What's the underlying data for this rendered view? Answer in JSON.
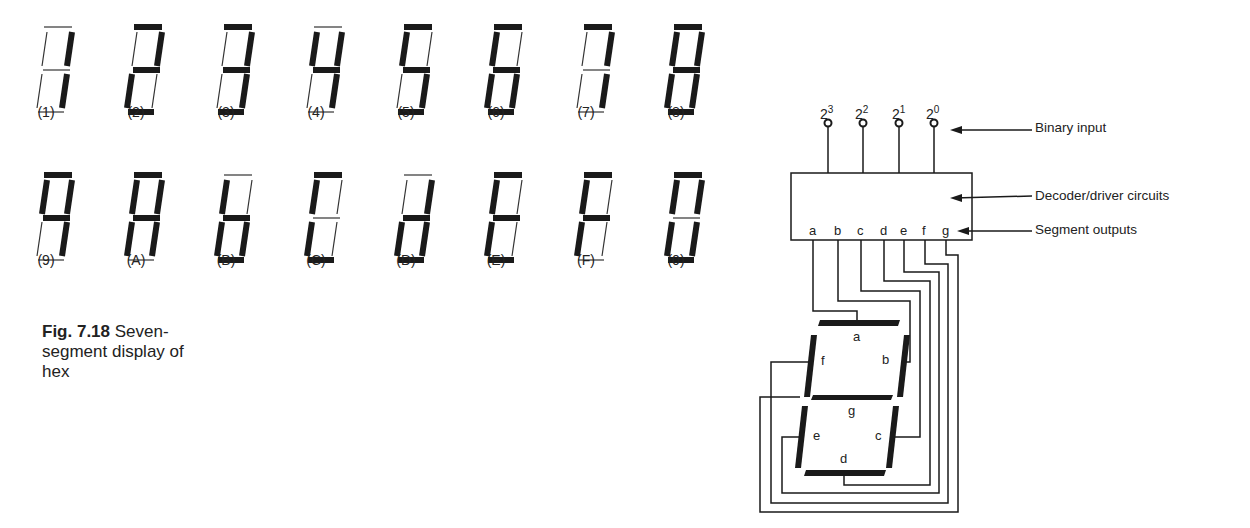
{
  "figure": {
    "number": "Fig. 7.18",
    "caption_lines": [
      "Seven-",
      "segment display of",
      "hex"
    ]
  },
  "digits": [
    {
      "label": "(1)",
      "on": [
        "b",
        "c"
      ]
    },
    {
      "label": "(2)",
      "on": [
        "a",
        "b",
        "g",
        "e",
        "d"
      ]
    },
    {
      "label": "(3)",
      "on": [
        "a",
        "b",
        "g",
        "c",
        "d"
      ]
    },
    {
      "label": "(4)",
      "on": [
        "f",
        "g",
        "b",
        "c"
      ]
    },
    {
      "label": "(5)",
      "on": [
        "a",
        "f",
        "g",
        "c",
        "d"
      ]
    },
    {
      "label": "(6)",
      "on": [
        "a",
        "f",
        "g",
        "e",
        "c",
        "d"
      ]
    },
    {
      "label": "(7)",
      "on": [
        "a",
        "b",
        "c"
      ]
    },
    {
      "label": "(8)",
      "on": [
        "a",
        "b",
        "c",
        "d",
        "e",
        "f",
        "g"
      ]
    },
    {
      "label": "(9)",
      "on": [
        "a",
        "b",
        "c",
        "f",
        "g"
      ]
    },
    {
      "label": "(A)",
      "on": [
        "a",
        "b",
        "c",
        "e",
        "f",
        "g"
      ]
    },
    {
      "label": "(B)",
      "on": [
        "f",
        "g",
        "e",
        "c",
        "d"
      ]
    },
    {
      "label": "(C)",
      "on": [
        "a",
        "f",
        "e",
        "d"
      ]
    },
    {
      "label": "(D)",
      "on": [
        "b",
        "g",
        "e",
        "c",
        "d"
      ]
    },
    {
      "label": "(E)",
      "on": [
        "a",
        "f",
        "g",
        "e",
        "d"
      ]
    },
    {
      "label": "(F)",
      "on": [
        "a",
        "f",
        "g",
        "e"
      ]
    },
    {
      "label": "(0)",
      "on": [
        "a",
        "b",
        "c",
        "d",
        "e",
        "f"
      ]
    }
  ],
  "decoder": {
    "inputs": [
      {
        "base": "2",
        "exp": "3"
      },
      {
        "base": "2",
        "exp": "2"
      },
      {
        "base": "2",
        "exp": "1"
      },
      {
        "base": "2",
        "exp": "0"
      }
    ],
    "outputs": [
      "a",
      "b",
      "c",
      "d",
      "e",
      "f",
      "g"
    ],
    "callouts": {
      "binary_input": "Binary input",
      "decoder": "Decoder/driver circuits",
      "segment_outputs": "Segment outputs"
    },
    "segment_labels": {
      "a": "a",
      "b": "b",
      "c": "c",
      "d": "d",
      "e": "e",
      "f": "f",
      "g": "g"
    }
  },
  "colors": {
    "ink": "#1a1a1a",
    "background": "#ffffff",
    "off_segment": "#333333"
  }
}
